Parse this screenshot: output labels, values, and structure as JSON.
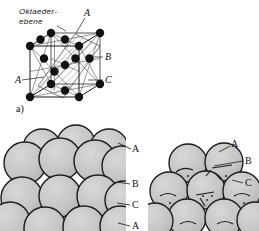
{
  "figure": {
    "title_note": "Oktaederebene in kubisch-flaechenzentriertem Gitter mit ABC-Stapelfolge",
    "panel_a": {
      "caption": "a)",
      "handwritten_label_line1": "Oktaeder-",
      "handwritten_label_line2": "ebene",
      "labels": {
        "top_a": "A",
        "right_b": "B",
        "right_c": "C",
        "left_a": "A"
      }
    },
    "panel_left_packing": {
      "labels": {
        "a_top": "A",
        "b_mid": "B",
        "c_mid": "C",
        "a_bottom": "A"
      }
    },
    "panel_right_packing": {
      "labels": {
        "a_top": "A",
        "b_mid": "B",
        "c_mid": "C"
      }
    },
    "colors": {
      "sphere_fill": "#c6c6c6",
      "sphere_stroke": "#1a1a1a",
      "line": "#1a1a1a",
      "hatch": "#7a7a7a",
      "atom_fill": "#121212",
      "background": "#ffffff"
    }
  }
}
